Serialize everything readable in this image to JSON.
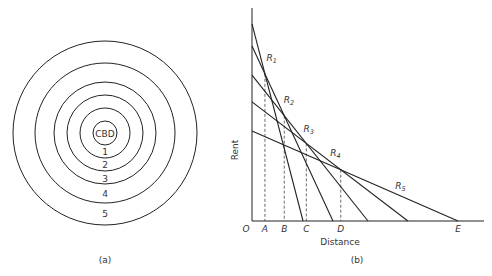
{
  "panel_a": {
    "caption": "(a)",
    "center_label": "CBD",
    "zones": [
      "1",
      "2",
      "3",
      "4",
      "5"
    ]
  },
  "panel_b": {
    "caption": "(b)",
    "xlabel": "Distance",
    "ylabel": "Rent",
    "origin_label": "O",
    "boundary_labels": [
      "A",
      "B",
      "C",
      "D",
      "E"
    ]
  },
  "chart_data": {
    "type": "line",
    "title": "",
    "xlabel": "Distance",
    "ylabel": "Rent",
    "xlim": [
      0,
      1
    ],
    "ylim": [
      0,
      1
    ],
    "grid": false,
    "series": [
      {
        "name": "R1",
        "rent_intercept": 0.925,
        "distance_intercept": 0.22
      },
      {
        "name": "R2",
        "rent_intercept": 0.822,
        "distance_intercept": 0.349
      },
      {
        "name": "R3",
        "rent_intercept": 0.685,
        "distance_intercept": 0.5
      },
      {
        "name": "R4",
        "rent_intercept": 0.559,
        "distance_intercept": 0.672
      },
      {
        "name": "R5",
        "rent_intercept": 0.423,
        "distance_intercept": 0.888
      }
    ],
    "boundaries": [
      {
        "label": "A",
        "between": [
          "R1",
          "R2"
        ]
      },
      {
        "label": "B",
        "between": [
          "R2",
          "R3"
        ]
      },
      {
        "label": "C",
        "between": [
          "R3",
          "R4"
        ]
      },
      {
        "label": "D",
        "between": [
          "R4",
          "R5"
        ]
      },
      {
        "label": "E",
        "at": "R5"
      }
    ]
  }
}
